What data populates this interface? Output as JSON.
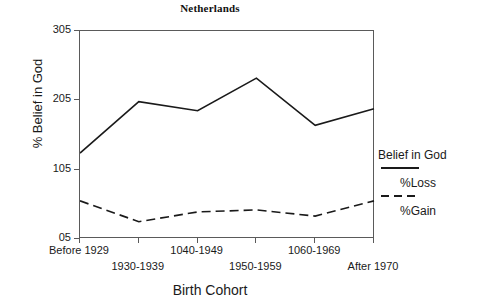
{
  "chart_data": {
    "type": "line",
    "title": "Netherlands",
    "xlabel": "Birth Cohort",
    "ylabel": "% Belief in God",
    "categories": [
      "Before 1929",
      "1930-1939",
      "1040-1949",
      "1950-1959",
      "1060-1969",
      "After 1970"
    ],
    "yticks": [
      "305",
      "205",
      "105",
      "05"
    ],
    "ytick_values": [
      305,
      205,
      105,
      5
    ],
    "ylim": [
      5,
      305
    ],
    "grid": false,
    "legend_position": "right",
    "series": [
      {
        "name": "Belief in God",
        "style": "solid",
        "color": "#1a1a1a",
        "values": [
          129,
          203,
          190,
          237,
          169,
          193
        ]
      },
      {
        "name": "%Loss",
        "style": "dashed",
        "color": "#1a1a1a",
        "values": [
          60,
          30,
          44,
          47,
          38,
          60
        ]
      }
    ],
    "legend": [
      {
        "label": "Belief in God",
        "style": "solid"
      },
      {
        "label": "%Loss",
        "style": "dashed"
      },
      {
        "label": "%Gain",
        "style": "none"
      }
    ]
  }
}
